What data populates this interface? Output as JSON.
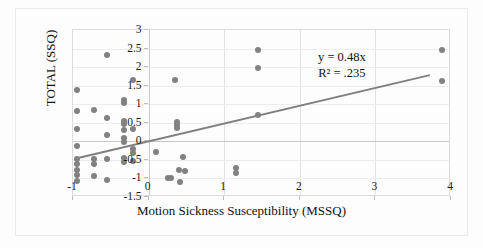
{
  "chart": {
    "xlabel": "Motion Sickness Susceptibility (MSSQ)",
    "ylabel": "TOTAL (SSQ)",
    "equation_line1": "y = 0.48x",
    "equation_line2": "R² = .235"
  },
  "chart_data": {
    "type": "scatter",
    "title": "",
    "xlabel": "Motion Sickness Susceptibility (MSSQ)",
    "ylabel": "TOTAL (SSQ)",
    "xlim": [
      -1,
      4
    ],
    "ylim": [
      -1.5,
      3
    ],
    "xticks": [
      -1,
      0,
      1,
      2,
      3,
      4
    ],
    "xticklabels": [
      "-1",
      "0",
      "1",
      "2",
      "3",
      "4"
    ],
    "yticks": [
      -1.5,
      -1,
      -0.5,
      0,
      0.5,
      1,
      1.5,
      2,
      2.5,
      3
    ],
    "yticklabels": [
      "-1.5",
      "-1",
      "-0.5",
      "0",
      "0.5",
      "1",
      "1.5",
      "2",
      "2.5",
      "3"
    ],
    "grid": true,
    "legend": null,
    "marker_color": "#818181",
    "trendline": {
      "equation": "y = 0.48x",
      "r_squared": 0.235,
      "slope": 0.48,
      "intercept": 0.0,
      "color": "#808080",
      "x_start": -0.92,
      "x_end": 3.72,
      "annotation": [
        "y = 0.48x",
        "R² = .235"
      ]
    },
    "points": [
      [
        -0.95,
        1.38
      ],
      [
        -0.95,
        0.82
      ],
      [
        -0.95,
        0.33
      ],
      [
        -0.95,
        -0.12
      ],
      [
        -0.95,
        -0.47
      ],
      [
        -0.95,
        -0.62
      ],
      [
        -0.95,
        -0.77
      ],
      [
        -0.95,
        -0.92
      ],
      [
        -0.95,
        -1.08
      ],
      [
        -0.72,
        0.84
      ],
      [
        -0.72,
        -0.48
      ],
      [
        -0.72,
        -0.62
      ],
      [
        -0.72,
        -0.93
      ],
      [
        -0.55,
        2.32
      ],
      [
        -0.55,
        0.62
      ],
      [
        -0.55,
        0.18
      ],
      [
        -0.55,
        -0.47
      ],
      [
        -0.55,
        -1.05
      ],
      [
        -0.33,
        1.12
      ],
      [
        -0.33,
        1.03
      ],
      [
        -0.33,
        0.55
      ],
      [
        -0.33,
        0.48
      ],
      [
        -0.33,
        0.3
      ],
      [
        -0.33,
        0.1
      ],
      [
        -0.33,
        -0.03
      ],
      [
        -0.33,
        -0.45
      ],
      [
        -0.33,
        -0.55
      ],
      [
        -0.2,
        1.65
      ],
      [
        -0.2,
        0.33
      ],
      [
        -0.2,
        -0.2
      ],
      [
        -0.2,
        -0.32
      ],
      [
        -0.2,
        -0.52
      ],
      [
        0.1,
        -0.28
      ],
      [
        0.25,
        -0.98
      ],
      [
        0.3,
        -0.98
      ],
      [
        0.35,
        1.65
      ],
      [
        0.38,
        0.52
      ],
      [
        0.38,
        0.45
      ],
      [
        0.38,
        0.35
      ],
      [
        0.4,
        -0.78
      ],
      [
        0.42,
        -1.1
      ],
      [
        0.45,
        -0.42
      ],
      [
        0.48,
        -0.8
      ],
      [
        1.15,
        -0.72
      ],
      [
        1.15,
        -0.85
      ],
      [
        1.45,
        2.45
      ],
      [
        1.45,
        1.98
      ],
      [
        1.45,
        0.72
      ],
      [
        3.88,
        2.45
      ],
      [
        3.88,
        1.62
      ]
    ]
  }
}
